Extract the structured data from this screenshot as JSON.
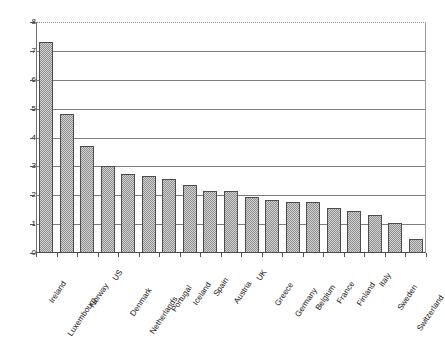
{
  "chart_data": {
    "type": "bar",
    "title": "",
    "subtitle": "",
    "xlabel": "",
    "ylabel": "",
    "ylim": [
      0,
      8
    ],
    "y_ticks": [
      0,
      1,
      2,
      3,
      4,
      5,
      6,
      7,
      8
    ],
    "grid": "horizontal",
    "legend": "none",
    "orientation": "vertical",
    "bar_fill": "#b4b4b4",
    "bar_edge": "#4c4c4c",
    "gridline_color": "#7d7d7d",
    "axis_color": "#555555",
    "label_rotation_degrees": -56,
    "categories": [
      "Ireland",
      "Luxembourg",
      "Norway",
      "US",
      "Denmark",
      "Netherlands",
      "Portugal",
      "Iceland",
      "Spain",
      "Austria",
      "UK",
      "Greece",
      "Germany",
      "Belgium",
      "France",
      "Finland",
      "Italy",
      "Sweden",
      "Switzerland"
    ],
    "values": [
      7.3,
      4.8,
      3.7,
      3.0,
      2.75,
      2.65,
      2.55,
      2.35,
      2.15,
      2.15,
      1.95,
      1.85,
      1.75,
      1.75,
      1.55,
      1.45,
      1.3,
      1.05,
      0.5
    ]
  }
}
